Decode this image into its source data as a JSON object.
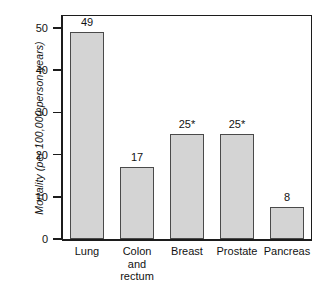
{
  "chart_data": {
    "type": "bar",
    "title": "",
    "subtitle": "",
    "xlabel": "",
    "ylabel": "Mortality (per 100,000 person-years)",
    "categories": [
      "Lung",
      "Colon and rectum",
      "Breast",
      "Prostate",
      "Pancreas"
    ],
    "category_lines": [
      [
        "Lung"
      ],
      [
        "Colon",
        "and",
        "rectum"
      ],
      [
        "Breast"
      ],
      [
        "Prostate"
      ],
      [
        "Pancreas"
      ]
    ],
    "values": [
      49,
      17,
      25,
      25,
      8
    ],
    "data_labels": [
      "49",
      "17",
      "25*",
      "25*",
      "8"
    ],
    "ylim": [
      0,
      53
    ],
    "yticks": [
      0,
      10,
      20,
      30,
      40,
      50
    ],
    "ytick_labels": [
      "0",
      "10",
      "20",
      "30",
      "40",
      "50"
    ],
    "grid": false,
    "legend": false,
    "legend_position": "none",
    "annotations": [
      "* asterisk marks Breast and Prostate values"
    ],
    "colors": {
      "bar_fill": "#d4d4d4",
      "bar_border": "#4a4a4a",
      "axis": "#1c1c1c",
      "text": "#121212",
      "background": "#ffffff"
    }
  }
}
